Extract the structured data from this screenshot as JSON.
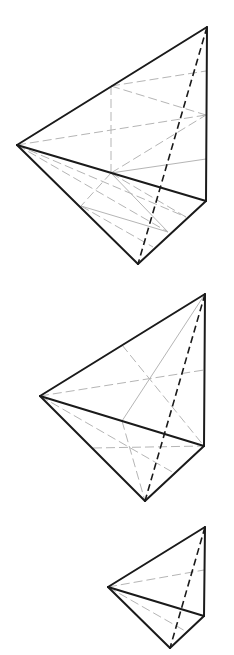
{
  "figure": {
    "colors": {
      "background": "#ffffff",
      "edge": "#1a1a1a",
      "auxiliary": "#b5b5b5"
    },
    "tetrahedra": [
      {
        "id": "tetrahedron-1",
        "vertices": {
          "L": [
            17,
            145
          ],
          "T": [
            207,
            27
          ],
          "R": [
            206,
            201
          ],
          "B": [
            138,
            264
          ]
        },
        "solid_edges": [
          [
            "L",
            "T"
          ],
          [
            "T",
            "R"
          ],
          [
            "L",
            "R"
          ],
          [
            "L",
            "B"
          ],
          [
            "R",
            "B"
          ]
        ],
        "hidden_edges": [
          [
            "T",
            "B"
          ]
        ],
        "aux_lines": [
          {
            "from": [
              111,
              86
            ],
            "to": [
              111,
              173
            ],
            "style": "dashed"
          },
          {
            "from": [
              111,
              86
            ],
            "to": [
              206,
              71
            ],
            "style": "dashed"
          },
          {
            "from": [
              111,
              86
            ],
            "to": [
              206,
              115
            ],
            "style": "dashed"
          },
          {
            "from": [
              17,
              145
            ],
            "to": [
              206,
              115
            ],
            "style": "dashed"
          },
          {
            "from": [
              111,
              173
            ],
            "to": [
              206,
              115
            ],
            "style": "dashed"
          },
          {
            "from": [
              111,
              173
            ],
            "to": [
              206,
              159
            ],
            "style": "solid"
          },
          {
            "from": [
              111,
              173
            ],
            "to": [
              81,
              206
            ],
            "style": "dashed"
          },
          {
            "from": [
              111,
              173
            ],
            "to": [
              168,
              232
            ],
            "style": "solid"
          },
          {
            "from": [
              111,
              173
            ],
            "to": [
              186,
              217
            ],
            "style": "dashed"
          },
          {
            "from": [
              17,
              145
            ],
            "to": [
              168,
              232
            ],
            "style": "dashed"
          },
          {
            "from": [
              17,
              145
            ],
            "to": [
              186,
              217
            ],
            "style": "dashed"
          },
          {
            "from": [
              81,
              206
            ],
            "to": [
              168,
              232
            ],
            "style": "solid"
          },
          {
            "from": [
              81,
              206
            ],
            "to": [
              153,
              247
            ],
            "style": "dashed"
          }
        ]
      },
      {
        "id": "tetrahedron-2",
        "vertices": {
          "L": [
            40,
            396
          ],
          "T": [
            205,
            294
          ],
          "R": [
            204,
            446
          ],
          "B": [
            145,
            501
          ]
        },
        "solid_edges": [
          [
            "L",
            "T"
          ],
          [
            "T",
            "R"
          ],
          [
            "L",
            "R"
          ],
          [
            "L",
            "B"
          ],
          [
            "R",
            "B"
          ]
        ],
        "hidden_edges": [
          [
            "T",
            "B"
          ]
        ],
        "aux_lines": [
          {
            "from": [
              122,
              345
            ],
            "to": [
              204,
              446
            ],
            "style": "dashed"
          },
          {
            "from": [
              40,
              396
            ],
            "to": [
              204,
              370
            ],
            "style": "dashed"
          },
          {
            "from": [
              205,
              294
            ],
            "to": [
              122,
              421
            ],
            "style": "solid"
          },
          {
            "from": [
              122,
              421
            ],
            "to": [
              145,
              501
            ],
            "style": "dashed"
          },
          {
            "from": [
              40,
              396
            ],
            "to": [
              174,
              473
            ],
            "style": "dashed"
          },
          {
            "from": [
              93,
              448
            ],
            "to": [
              204,
              446
            ],
            "style": "dashed"
          }
        ]
      },
      {
        "id": "tetrahedron-3",
        "vertices": {
          "L": [
            108,
            587
          ],
          "T": [
            205,
            527
          ],
          "R": [
            204,
            616
          ],
          "B": [
            170,
            648
          ]
        },
        "solid_edges": [
          [
            "L",
            "T"
          ],
          [
            "T",
            "R"
          ],
          [
            "L",
            "R"
          ],
          [
            "L",
            "B"
          ],
          [
            "R",
            "B"
          ]
        ],
        "hidden_edges": [
          [
            "T",
            "B"
          ]
        ],
        "aux_lines": [
          {
            "from": [
              108,
              587
            ],
            "to": [
              204,
              570
            ],
            "style": "dashed"
          },
          {
            "from": [
              108,
              587
            ],
            "to": [
              187,
              632
            ],
            "style": "dashed"
          }
        ]
      }
    ]
  }
}
